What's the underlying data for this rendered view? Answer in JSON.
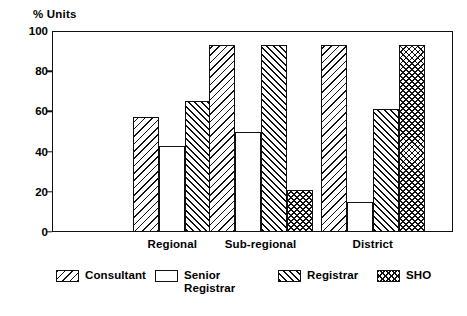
{
  "chart_data": {
    "type": "bar",
    "title": "",
    "subtitle": "",
    "xlabel": "",
    "ylabel": "% Units",
    "ylim": [
      0,
      100
    ],
    "yticks": [
      0,
      20,
      40,
      60,
      80,
      100
    ],
    "ytick_labels": [
      "0",
      "20",
      "40",
      "60",
      "80",
      "100"
    ],
    "grid": false,
    "legend_position": "bottom",
    "categories": [
      "Regional",
      "Sub-regional",
      "District"
    ],
    "series": [
      {
        "name": "Consultant",
        "values": [
          57,
          93,
          93
        ]
      },
      {
        "name": "Senior\nRegistrar",
        "values": [
          43,
          50,
          15
        ]
      },
      {
        "name": "Registrar",
        "values": [
          65,
          93,
          61
        ]
      },
      {
        "name": "SHO",
        "values": [
          null,
          21,
          93
        ]
      }
    ],
    "annotations": []
  },
  "legend": {
    "items": [
      {
        "label": "Consultant",
        "pattern": "diagonal-hatch-left",
        "color": "#111111"
      },
      {
        "label": "Senior\nRegistrar",
        "pattern": "dotted-stipple",
        "color": "#9a9a9a"
      },
      {
        "label": "Registrar",
        "pattern": "diagonal-hatch-right",
        "color": "#111111"
      },
      {
        "label": "SHO",
        "pattern": "cross-hatch",
        "color": "#111111"
      }
    ]
  },
  "axis": {
    "title": "% Units"
  }
}
